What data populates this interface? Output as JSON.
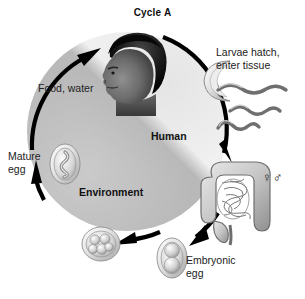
{
  "figure": {
    "title": "Cycle A",
    "type": "life-cycle-diagram",
    "background_color": "#ffffff"
  },
  "cycle": {
    "human_region": {
      "label": "Human",
      "fill_color": "#f2f2f2"
    },
    "environment_region": {
      "label": "Environment",
      "fill_color": "#b9b9b9"
    },
    "arrow_color": "#000000",
    "direction": "clockwise"
  },
  "labels": {
    "food_water": "Food, water",
    "human": "Human",
    "environment": "Environment",
    "mature_egg": "Mature\negg",
    "embryonic_egg": "Embryonic\negg",
    "larvae_hatch": "Larvae hatch,\nenter tissue",
    "sexes": "♀♂"
  },
  "stages": [
    {
      "name": "human-host",
      "icon": "human-head-photo",
      "label": "Human"
    },
    {
      "name": "ingestion",
      "icon": "arrow-up",
      "label": "Food, water"
    },
    {
      "name": "larvae-hatching",
      "icon": "hatching-egg-with-larvae",
      "label": "Larvae hatch, enter tissue"
    },
    {
      "name": "intestine-adults",
      "icon": "intestine",
      "label": "♀♂"
    },
    {
      "name": "embryonic-egg",
      "icon": "egg-two-cell",
      "label": "Embryonic egg"
    },
    {
      "name": "morula-egg",
      "icon": "egg-multicell",
      "label": ""
    },
    {
      "name": "mature-egg",
      "icon": "egg-coiled-larva",
      "label": "Mature egg"
    }
  ]
}
